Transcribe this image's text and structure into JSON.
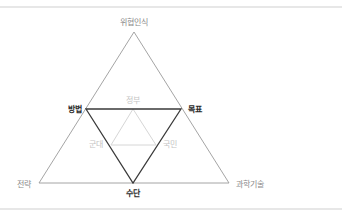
{
  "diagram": {
    "type": "nested-triangle",
    "outer_triangle": {
      "color": "#9a9a9a",
      "vertices": {
        "top": "위협인식",
        "bottom_left": "전략",
        "bottom_right": "과학기술"
      }
    },
    "middle_triangle": {
      "color": "#3a3a3a",
      "orientation": "inverted",
      "vertices": {
        "top_left": "방법",
        "top_right": "목표",
        "bottom": "수단"
      }
    },
    "inner_triangle": {
      "color": "#d6d6d6",
      "vertices": {
        "top": "정부",
        "bottom_left": "군대",
        "bottom_right": "국민"
      }
    },
    "rule_color": "#cfcfcf"
  }
}
